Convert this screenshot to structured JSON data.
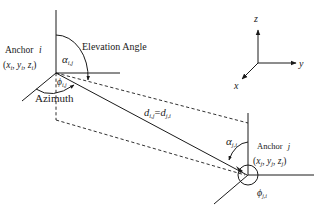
{
  "anchor_i": {
    "title": "Anchor",
    "index": "i",
    "coords": "(x_i, y_i, z_i)",
    "coords_parts": {
      "open": "(",
      "x": "x",
      "y": "y",
      "z": "z",
      "sub": "i",
      "close": ")"
    },
    "elevation_symbol": "α",
    "elevation_sub": "i,j",
    "azimuth_symbol": "ϕ",
    "azimuth_sub": "i,j"
  },
  "anchor_j": {
    "title": "Anchor",
    "index": "j",
    "coords": "(x_j, y_j, z_j)",
    "coords_parts": {
      "open": "(",
      "x": "x",
      "y": "y",
      "z": "z",
      "sub": "j",
      "close": ")"
    },
    "elevation_symbol": "α",
    "elevation_sub": "j,i",
    "azimuth_symbol": "ϕ",
    "azimuth_sub": "j,i"
  },
  "labels": {
    "elevation_angle": "Elevation Angle",
    "azimuth": "Azimuth",
    "distance": "d_{i,j} = d_{j,i}",
    "distance_parts": {
      "d1": "d",
      "sub1": "i,j",
      "eq": "=",
      "d2": "d",
      "sub2": "j,i"
    }
  },
  "axes_legend": {
    "x": "x",
    "y": "y",
    "z": "z"
  }
}
